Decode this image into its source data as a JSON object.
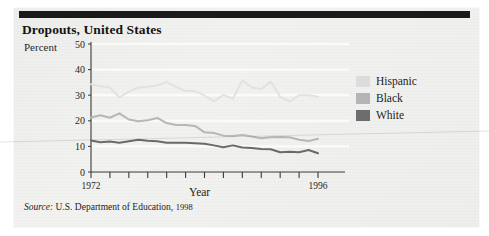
{
  "figure": {
    "title": "Dropouts, United States",
    "source_keyword": "Source:",
    "source_text": "U.S. Department of Education,",
    "source_year": "1998"
  },
  "chart_data": {
    "type": "line",
    "title": "Dropouts, United States",
    "xlabel": "Year",
    "ylabel": "Percent",
    "xlim": [
      1972,
      1996
    ],
    "ylim": [
      0,
      50
    ],
    "ytick_labels": [
      "0",
      "10",
      "20",
      "30",
      "40",
      "50"
    ],
    "yticks": [
      0,
      10,
      20,
      30,
      40,
      50
    ],
    "xtick_labels": [
      "1972",
      "1996"
    ],
    "xticks": [
      1972,
      1974,
      1976,
      1978,
      1980,
      1982,
      1984,
      1986,
      1988,
      1990,
      1992,
      1994,
      1996
    ],
    "grid": "horizontal-white",
    "legend_position": "right",
    "x": [
      1972,
      1973,
      1974,
      1975,
      1976,
      1977,
      1978,
      1979,
      1980,
      1981,
      1982,
      1983,
      1984,
      1985,
      1986,
      1987,
      1988,
      1989,
      1990,
      1991,
      1992,
      1993,
      1994,
      1995,
      1996
    ],
    "series": [
      {
        "name": "Hispanic",
        "color": "#e2e2e2",
        "values": [
          34.3,
          33.5,
          33.0,
          29.2,
          31.4,
          33.0,
          33.3,
          33.8,
          35.2,
          33.2,
          31.7,
          31.6,
          29.8,
          27.6,
          30.1,
          28.6,
          35.8,
          33.0,
          32.4,
          35.3,
          29.4,
          27.5,
          30.0,
          30.0,
          29.4
        ]
      },
      {
        "name": "Black",
        "color": "#b7b7b7",
        "values": [
          21.3,
          22.2,
          21.2,
          22.9,
          20.5,
          19.8,
          20.2,
          21.1,
          19.1,
          18.4,
          18.4,
          18.0,
          15.5,
          15.2,
          14.2,
          14.1,
          14.5,
          13.9,
          13.2,
          13.6,
          13.7,
          13.6,
          12.6,
          12.1,
          13.0
        ]
      },
      {
        "name": "White",
        "color": "#6a6a6a",
        "values": [
          12.3,
          11.6,
          11.9,
          11.4,
          12.0,
          12.6,
          12.2,
          12.0,
          11.4,
          11.4,
          11.4,
          11.2,
          11.0,
          10.4,
          9.7,
          10.4,
          9.6,
          9.4,
          9.0,
          8.9,
          7.7,
          7.9,
          7.7,
          8.6,
          7.3
        ]
      }
    ]
  },
  "legend": {
    "items": [
      {
        "label": "Hispanic",
        "color": "#dcdcdc"
      },
      {
        "label": "Black",
        "color": "#b5b5b5"
      },
      {
        "label": "White",
        "color": "#6d6d6d"
      }
    ]
  }
}
